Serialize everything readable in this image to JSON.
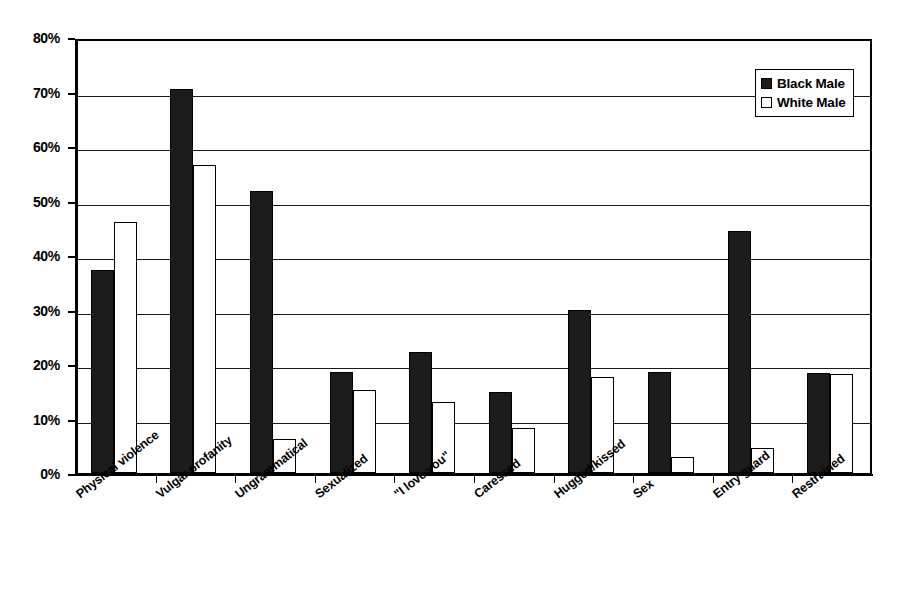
{
  "chart_data": {
    "type": "bar",
    "title": "",
    "xlabel": "",
    "ylabel": "",
    "ylim": [
      0,
      80
    ],
    "y_tick_labels": [
      "0%",
      "10%",
      "20%",
      "30%",
      "40%",
      "50%",
      "60%",
      "70%",
      "80%"
    ],
    "y_tick_values": [
      0,
      10,
      20,
      30,
      40,
      50,
      60,
      70,
      80
    ],
    "grid": true,
    "legend_position": "top-right",
    "categories": [
      "Physical violence",
      "Vulgar profanity",
      "Ungrammatical",
      "Sexualized",
      "\"I love you\"",
      "Caressed",
      "Hugged/kissed",
      "Sex",
      "Entry guard",
      "Restrained"
    ],
    "series": [
      {
        "name": "Black Male",
        "color": "#1c1c1c",
        "values": [
          37.2,
          70.4,
          51.8,
          18.5,
          22.2,
          14.9,
          29.9,
          18.5,
          44.4,
          18.4
        ]
      },
      {
        "name": "White Male",
        "color": "#ffffff",
        "values": [
          46.0,
          56.5,
          6.3,
          15.3,
          13.0,
          8.2,
          17.6,
          2.9,
          4.6,
          18.2
        ]
      }
    ]
  },
  "legend": {
    "items": [
      {
        "label": "Black Male",
        "swatch": "black"
      },
      {
        "label": "White Male",
        "swatch": "white"
      }
    ]
  }
}
